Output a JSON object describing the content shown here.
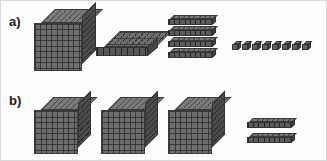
{
  "page": {
    "background_color": "#fefefe",
    "border_color": "#d9d9d9",
    "width": 327,
    "height": 161
  },
  "palette": {
    "block_face": "#6d6d6d",
    "block_side": "#4c4c4c",
    "block_top": "#7b7b7b",
    "grid_line": "#3a3a3a",
    "label_color": "#1a1a1a"
  },
  "rows": [
    {
      "id": "a",
      "label": "a)",
      "label_x": 8,
      "label_y": 14,
      "groups": [
        {
          "kind": "thousand-cube",
          "name": "thousand-cube-block",
          "count": 1,
          "value_each": 1000,
          "items": [
            {
              "x": 33,
              "y": 8,
              "size": 48
            }
          ]
        },
        {
          "kind": "hundred-flat",
          "name": "hundred-flat-block",
          "count": 1,
          "value_each": 100,
          "items": [
            {
              "x": 95,
              "y": 30,
              "w": 52,
              "h": 9
            }
          ]
        },
        {
          "kind": "ten-rod",
          "name": "ten-rod-block",
          "count": 4,
          "value_each": 10,
          "items": [
            {
              "x": 167,
              "y": 14,
              "w": 44,
              "h": 6
            },
            {
              "x": 167,
              "y": 25,
              "w": 44,
              "h": 6
            },
            {
              "x": 167,
              "y": 36,
              "w": 44,
              "h": 6
            },
            {
              "x": 167,
              "y": 47,
              "w": 44,
              "h": 6
            }
          ]
        },
        {
          "kind": "unit-cube",
          "name": "unit-cube-block",
          "count": 8,
          "value_each": 1,
          "items": [
            {
              "x": 231,
              "y": 40,
              "size": 6
            },
            {
              "x": 241,
              "y": 40,
              "size": 6
            },
            {
              "x": 251,
              "y": 40,
              "size": 6
            },
            {
              "x": 261,
              "y": 40,
              "size": 6
            },
            {
              "x": 271,
              "y": 40,
              "size": 6
            },
            {
              "x": 281,
              "y": 40,
              "size": 6
            },
            {
              "x": 291,
              "y": 40,
              "size": 6
            },
            {
              "x": 301,
              "y": 40,
              "size": 6
            }
          ]
        }
      ]
    },
    {
      "id": "b",
      "label": "b)",
      "label_x": 8,
      "label_y": 93,
      "groups": [
        {
          "kind": "thousand-cube",
          "name": "thousand-cube-block",
          "count": 3,
          "value_each": 1000,
          "items": [
            {
              "x": 33,
              "y": 96,
              "size": 44
            },
            {
              "x": 100,
              "y": 96,
              "size": 44
            },
            {
              "x": 167,
              "y": 96,
              "size": 44
            }
          ]
        },
        {
          "kind": "ten-rod",
          "name": "ten-rod-block",
          "count": 2,
          "value_each": 10,
          "items": [
            {
              "x": 246,
              "y": 117,
              "w": 44,
              "h": 6
            },
            {
              "x": 246,
              "y": 132,
              "w": 44,
              "h": 6
            }
          ]
        }
      ]
    }
  ]
}
